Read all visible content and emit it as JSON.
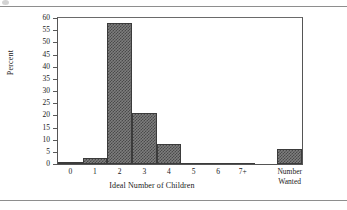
{
  "chart_data": {
    "type": "bar",
    "title": "",
    "subtitle": "",
    "xlabel": "Ideal Number of Children",
    "ylabel": "Percent",
    "categories": [
      "0",
      "1",
      "2",
      "3",
      "4",
      "5",
      "6",
      "7+",
      "Number Wanted"
    ],
    "values": [
      1,
      2.5,
      58,
      21,
      8.3,
      0.5,
      0.1,
      0.1,
      6
    ],
    "ylim": [
      0,
      60
    ],
    "yticks": [
      0,
      5,
      10,
      15,
      20,
      25,
      30,
      35,
      40,
      45,
      50,
      55,
      60
    ],
    "ytick_labels": [
      "0",
      "5",
      "10",
      "15",
      "20",
      "25",
      "30",
      "35",
      "40",
      "45",
      "50",
      "55",
      "60"
    ],
    "grid": false,
    "legend": false,
    "legend_position": "none",
    "bar_fill": "#6e6e6e",
    "bar_edge": "#3b3b3b",
    "axis_color": "#555555",
    "background": "#ffffff",
    "bars": [
      {
        "label": "0",
        "value": 1,
        "two_line": false,
        "gap_before": false
      },
      {
        "label": "1",
        "value": 2.5,
        "two_line": false,
        "gap_before": false
      },
      {
        "label": "2",
        "value": 58,
        "two_line": false,
        "gap_before": false
      },
      {
        "label": "3",
        "value": 21,
        "two_line": false,
        "gap_before": false
      },
      {
        "label": "4",
        "value": 8.3,
        "two_line": false,
        "gap_before": false
      },
      {
        "label": "5",
        "value": 0.5,
        "two_line": false,
        "gap_before": false
      },
      {
        "label": "6",
        "value": 0.1,
        "two_line": false,
        "gap_before": false
      },
      {
        "label": "7+",
        "value": 0.1,
        "two_line": false,
        "gap_before": false
      },
      {
        "label": "Number Wanted",
        "value": 6,
        "two_line": true,
        "gap_before": true
      }
    ]
  }
}
